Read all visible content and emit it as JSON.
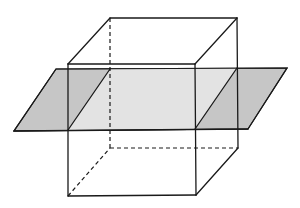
{
  "figure": {
    "title": "",
    "colors": {
      "plane_outside_cube": "#c6c6c6",
      "plane_inside_cube": "#e3e3e3",
      "edge": "#1a1a1a",
      "background": "#ffffff"
    },
    "cube": {
      "front_face": {
        "top_left": [
          68,
          64
        ],
        "top_right": [
          195,
          64
        ],
        "bottom_right": [
          196,
          195
        ],
        "bottom_left": [
          68,
          196
        ]
      },
      "back_face": {
        "top_left": [
          110,
          18
        ],
        "top_right": [
          237,
          18
        ],
        "bottom_right": [
          238,
          148
        ],
        "bottom_left": [
          110,
          148
        ]
      },
      "hidden_edges": [
        "back-left vertical",
        "back bottom",
        "bottom-left depth"
      ]
    },
    "plane": {
      "corners": {
        "top_left": [
          56,
          69
        ],
        "top_right": [
          287,
          68
        ],
        "bottom_right": [
          248,
          129
        ],
        "bottom_left": [
          14,
          131
        ]
      },
      "cross_section": {
        "front_left": [
          68,
          130
        ],
        "back_left": [
          110,
          69
        ],
        "back_right": [
          237,
          68
        ],
        "front_right": [
          195,
          129
        ]
      }
    }
  }
}
